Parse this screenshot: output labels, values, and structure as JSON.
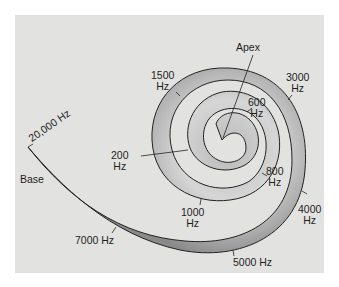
{
  "figure": {
    "colors": {
      "background": "#e2e2e0",
      "membrane_light": "#d9d9d9",
      "membrane_dark": "#8c8c8c",
      "outline": "#222222"
    },
    "endpoints": {
      "apex": "Apex",
      "base": "Base"
    },
    "frequency_labels": [
      {
        "id": "f20000",
        "line1": "20,000 Hz",
        "line2": ""
      },
      {
        "id": "f1500",
        "line1": "1500",
        "line2": "Hz"
      },
      {
        "id": "f3000",
        "line1": "3000",
        "line2": "Hz"
      },
      {
        "id": "f600",
        "line1": "600",
        "line2": "Hz"
      },
      {
        "id": "f200",
        "line1": "200",
        "line2": "Hz"
      },
      {
        "id": "f800",
        "line1": "800",
        "line2": "Hz"
      },
      {
        "id": "f1000",
        "line1": "1000",
        "line2": "Hz"
      },
      {
        "id": "f4000",
        "line1": "4000",
        "line2": "Hz"
      },
      {
        "id": "f7000",
        "line1": "7000 Hz",
        "line2": ""
      },
      {
        "id": "f5000",
        "line1": "5000 Hz",
        "line2": ""
      }
    ]
  }
}
